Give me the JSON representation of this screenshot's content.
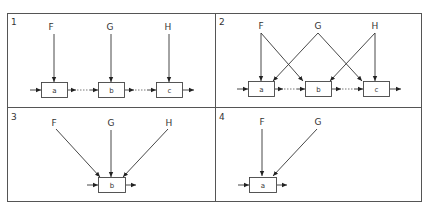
{
  "diagram": {
    "panels": [
      {
        "number": "1",
        "inputs": [
          "F",
          "G",
          "H"
        ],
        "boxes": [
          "a",
          "b",
          "c"
        ],
        "description": "Each input feeds exactly one box; boxes chained in sequence"
      },
      {
        "number": "2",
        "inputs": [
          "F",
          "G",
          "H"
        ],
        "boxes": [
          "a",
          "b",
          "c"
        ],
        "description": "F feeds a and b; G feeds a and c; H feeds b and c; boxes chained in sequence"
      },
      {
        "number": "3",
        "inputs": [
          "F",
          "G",
          "H"
        ],
        "boxes": [
          "b"
        ],
        "description": "All three inputs converge on a single box b"
      },
      {
        "number": "4",
        "inputs": [
          "F",
          "G"
        ],
        "boxes": [
          "a"
        ],
        "description": "Two inputs converge on a single box a"
      }
    ],
    "colors": {
      "line": "#333333",
      "frame": "#555555",
      "background": "#ffffff"
    }
  }
}
